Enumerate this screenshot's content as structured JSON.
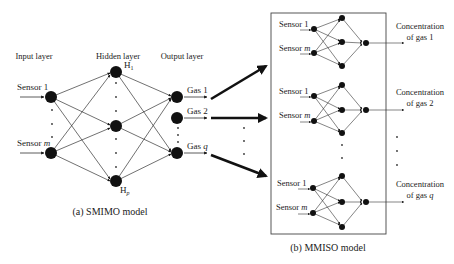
{
  "smimo": {
    "caption": "(a) SMIMO model",
    "layers": {
      "input": "Input layer",
      "hidden": "Hidden layer",
      "output": "Output layer"
    },
    "inputs": [
      "Sensor 1",
      "Sensor m"
    ],
    "hidden_top": "H",
    "hidden_top_sub": "1",
    "hidden_bottom": "H",
    "hidden_bottom_sub": "p",
    "outputs": [
      "Gas 1",
      "Gas 2",
      "Gas q"
    ]
  },
  "mmiso": {
    "caption": "(b) MMISO model",
    "subnets": [
      {
        "in1": "Sensor 1",
        "in2": "Sensor m",
        "out_line1": "Concentration",
        "out_line2": "of gas 1"
      },
      {
        "in1": "Sensor 1",
        "in2": "Sensor m",
        "out_line1": "Concentration",
        "out_line2": "of gas 2"
      },
      {
        "in1": "Sensor 1",
        "in2": "Sensor m",
        "out_line1": "Concentration",
        "out_line2": "of gas q"
      }
    ]
  },
  "colors": {
    "ink": "#111111",
    "line": "#333333",
    "text": "#222222"
  }
}
